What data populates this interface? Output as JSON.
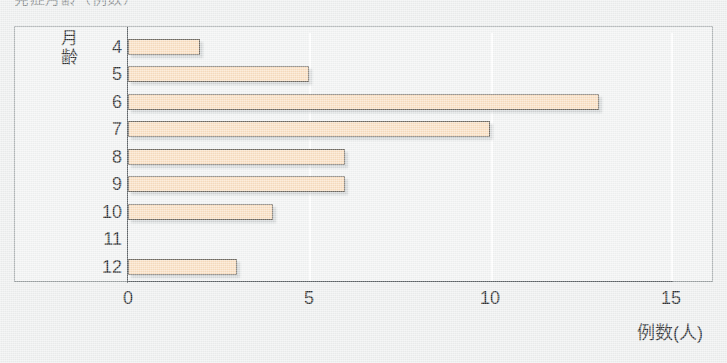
{
  "caption": {
    "text": "発症月齢（例数）"
  },
  "axes": {
    "y_title_chars": [
      "月",
      "齢"
    ],
    "x_title": "例数(人)",
    "x_ticks": [
      "0",
      "5",
      "10",
      "15"
    ]
  },
  "chart_data": {
    "type": "bar",
    "orientation": "horizontal",
    "title": "発症月齢（例数）",
    "xlabel": "例数(人)",
    "ylabel": "月齢",
    "categories": [
      "4",
      "5",
      "6",
      "7",
      "8",
      "9",
      "10",
      "11",
      "12"
    ],
    "values": [
      2,
      5,
      13,
      10,
      6,
      6,
      4,
      0,
      3
    ],
    "xlim": [
      0,
      15
    ],
    "xticks": [
      0,
      5,
      10,
      15
    ],
    "grid": true,
    "gridlines_at": [
      5,
      10,
      15
    ],
    "legend": "none",
    "bar_fill_color": "#fadfc0",
    "bar_border_color": "#6f6a62",
    "plot_background_color": "#f2f4f4",
    "page_background_color": "#eef0f0"
  }
}
